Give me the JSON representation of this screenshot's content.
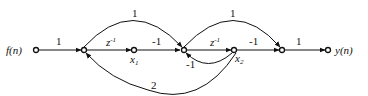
{
  "diagram": {
    "type": "signal-flow-graph",
    "input_label": "f(n)",
    "output_label": "y(n)",
    "nodes": [
      {
        "id": "in",
        "label": "f(n)"
      },
      {
        "id": "n1",
        "label": ""
      },
      {
        "id": "x1",
        "label": "x1"
      },
      {
        "id": "n2",
        "label": ""
      },
      {
        "id": "x2",
        "label": "x2"
      },
      {
        "id": "n3",
        "label": ""
      },
      {
        "id": "out",
        "label": "y(n)"
      }
    ],
    "edges": [
      {
        "from": "in",
        "to": "n1",
        "gain": "1"
      },
      {
        "from": "n1",
        "to": "x1",
        "gain": "z^-1"
      },
      {
        "from": "x1",
        "to": "n2",
        "gain": "-1"
      },
      {
        "from": "n1",
        "to": "n2",
        "gain": "1",
        "shape": "upper-arc"
      },
      {
        "from": "n2",
        "to": "x2",
        "gain": "z^-1"
      },
      {
        "from": "x2",
        "to": "n2",
        "gain": "-1",
        "shape": "lower-arc"
      },
      {
        "from": "x2",
        "to": "n3",
        "gain": "-1"
      },
      {
        "from": "n2",
        "to": "n3",
        "gain": "1",
        "shape": "upper-arc"
      },
      {
        "from": "n3",
        "to": "out",
        "gain": "1"
      },
      {
        "from": "x2",
        "to": "n1",
        "gain": "2",
        "shape": "lower-arc"
      }
    ],
    "labels": {
      "in_gain": "1",
      "z1": "z",
      "z1_exp": "-1",
      "x1_base": "x",
      "x1_sub": "1",
      "g_x1_n2": "-1",
      "arc_top1": "1",
      "z2": "z",
      "z2_exp": "-1",
      "x2_base": "x",
      "x2_sub": "2",
      "g_x2_n2": "-1",
      "g_x2_n3": "-1",
      "arc_top2": "1",
      "out_gain": "1",
      "feedback": "2"
    }
  }
}
